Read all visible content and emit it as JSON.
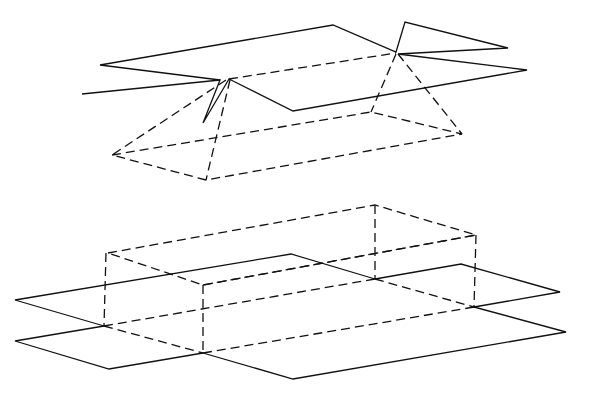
{
  "diagram": {
    "title": "",
    "figures": [
      {
        "id": "top-figure",
        "description": "Unfolded net of a triangular-roof / prism shape shown in perspective (solid net above dashed folded solid)"
      },
      {
        "id": "bottom-figure",
        "description": "Unfolded net of a rectangular box (cuboid) shown in perspective (solid net with dashed folded box)"
      }
    ],
    "line_color": "#111111",
    "background_color": "#ffffff",
    "line_styles": [
      "solid",
      "dashed"
    ]
  }
}
